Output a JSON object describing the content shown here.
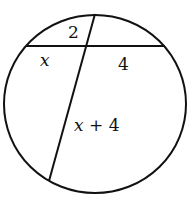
{
  "diagram": {
    "type": "intersecting-chords-in-circle",
    "circle": {
      "cx": 95,
      "cy": 104,
      "rx": 92,
      "ry": 90,
      "stroke": "#111111"
    },
    "chords": [
      {
        "name": "horizontal-chord",
        "x1": 27,
        "y1": 46,
        "x2": 164,
        "y2": 46
      },
      {
        "name": "slanted-chord",
        "x1": 95,
        "y1": 14,
        "x2": 49,
        "y2": 181
      }
    ],
    "labels": {
      "top_segment": "2",
      "left_segment": "x",
      "right_segment": "4",
      "bottom_segment_var": "x",
      "bottom_segment_rest": " + 4"
    }
  }
}
